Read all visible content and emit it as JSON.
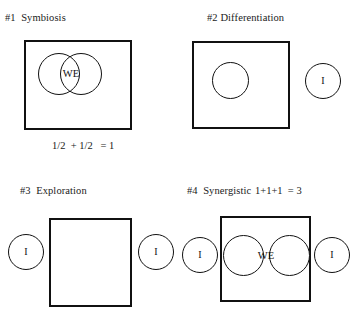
{
  "diagram": {
    "title_prefixes": [
      "#1",
      "#2",
      "#3",
      "#4"
    ],
    "panels": [
      {
        "id": "symbiosis",
        "title": "#1  Symbiosis",
        "caption": "1/2  + 1/2   = 1",
        "box_label": "",
        "circle_labels": [
          "WE"
        ],
        "outside_labels": []
      },
      {
        "id": "differentiation",
        "title": "#2 Differentiation",
        "caption": "",
        "box_label": "",
        "circle_labels": [
          ""
        ],
        "outside_labels": [
          "I"
        ]
      },
      {
        "id": "exploration",
        "title": "#3  Exploration",
        "caption": "",
        "box_label": "",
        "circle_labels": [],
        "outside_labels": [
          "I",
          "I"
        ]
      },
      {
        "id": "synergistic",
        "title": "#4  Synergistic",
        "caption": "1+1+1  = 3",
        "box_label": "",
        "circle_labels": [
          "WE"
        ],
        "outside_labels": [
          "I",
          "I"
        ]
      }
    ]
  },
  "colors": {
    "stroke": "#111111",
    "background": "#ffffff",
    "text": "#1a1a1a"
  }
}
